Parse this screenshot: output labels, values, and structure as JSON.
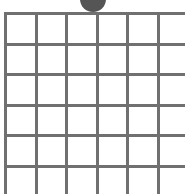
{
  "game": {
    "type": "grid-board",
    "columns": 6,
    "rows_visible": 6,
    "grid_line_color": "#707070",
    "cell_color": "#ffffff",
    "token": {
      "icon": "circle-token",
      "color": "#555555",
      "column": 3
    }
  }
}
